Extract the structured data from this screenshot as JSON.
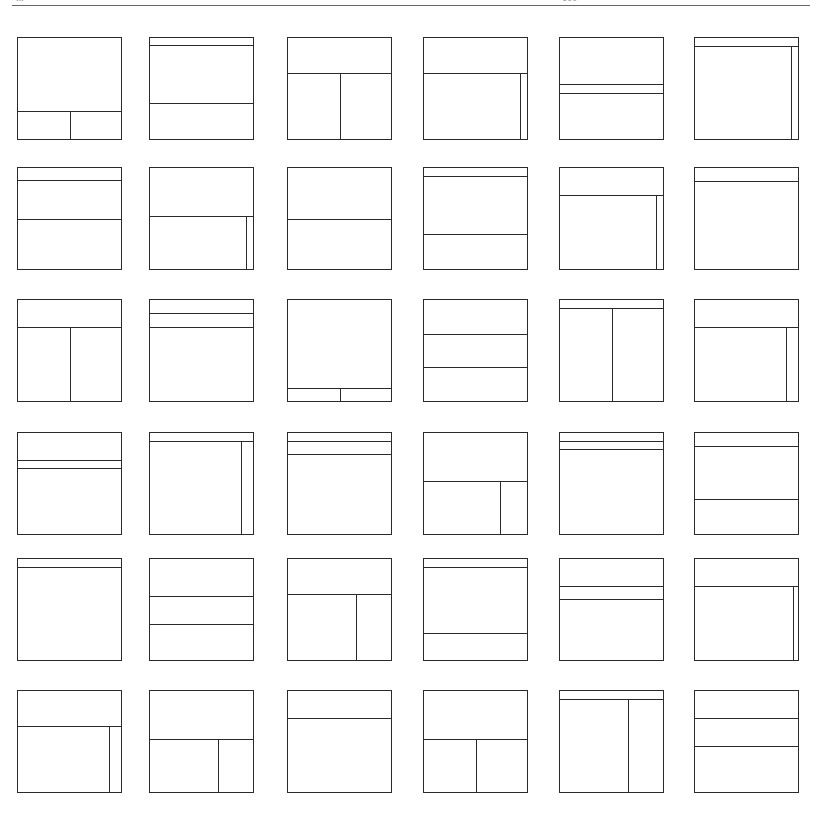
{
  "header": {
    "left_text": "...",
    "right_text": "100"
  },
  "grid": {
    "columns_x": [
      17,
      149,
      287,
      423,
      559,
      694
    ],
    "rows_y": [
      37,
      167,
      299,
      432,
      558,
      690
    ],
    "box_width": 105,
    "box_height": 103,
    "line_color": "#2a2a2a"
  },
  "layouts": [
    {
      "h": [
        0.72
      ],
      "v": [
        {
          "x": 0.5,
          "from": 0.72
        }
      ]
    },
    {
      "h": [
        0.07,
        0.64
      ],
      "v": []
    },
    {
      "h": [
        0.35
      ],
      "v": [
        {
          "x": 0.5,
          "from": 0.35
        }
      ]
    },
    {
      "h": [
        0.35
      ],
      "v": [
        {
          "x": 0.93,
          "from": 0.35
        }
      ]
    },
    {
      "h": [
        0.46,
        0.54
      ],
      "v": []
    },
    {
      "h": [
        0.08
      ],
      "v": [
        {
          "x": 0.93,
          "from": 0.08
        }
      ]
    },
    {
      "h": [
        0.12,
        0.5
      ],
      "v": []
    },
    {
      "h": [
        0.48
      ],
      "v": [
        {
          "x": 0.93,
          "from": 0.48
        }
      ]
    },
    {
      "h": [
        0.5
      ],
      "v": []
    },
    {
      "h": [
        0.08,
        0.65
      ],
      "v": []
    },
    {
      "h": [
        0.27
      ],
      "v": [
        {
          "x": 0.93,
          "from": 0.27
        }
      ]
    },
    {
      "h": [
        0.13
      ],
      "v": []
    },
    {
      "h": [
        0.27
      ],
      "v": [
        {
          "x": 0.5,
          "from": 0.27
        }
      ]
    },
    {
      "h": [
        0.13,
        0.27
      ],
      "v": []
    },
    {
      "h": [
        0.87
      ],
      "v": [
        {
          "x": 0.5,
          "from": 0.87
        }
      ]
    },
    {
      "h": [
        0.34,
        0.66
      ],
      "v": []
    },
    {
      "h": [
        0.08
      ],
      "v": [
        {
          "x": 0.5,
          "from": 0.08
        }
      ]
    },
    {
      "h": [
        0.27
      ],
      "v": [
        {
          "x": 0.88,
          "from": 0.27
        }
      ]
    },
    {
      "h": [
        0.27,
        0.35
      ],
      "v": []
    },
    {
      "h": [
        0.08
      ],
      "v": [
        {
          "x": 0.88,
          "from": 0.08
        }
      ]
    },
    {
      "h": [
        0.08,
        0.21
      ],
      "v": []
    },
    {
      "h": [
        0.48
      ],
      "v": [
        {
          "x": 0.74,
          "from": 0.48
        }
      ]
    },
    {
      "h": [
        0.08,
        0.16
      ],
      "v": []
    },
    {
      "h": [
        0.13,
        0.65
      ],
      "v": []
    },
    {
      "h": [
        0.08
      ],
      "v": []
    },
    {
      "h": [
        0.37,
        0.64
      ],
      "v": []
    },
    {
      "h": [
        0.35
      ],
      "v": [
        {
          "x": 0.66,
          "from": 0.35
        }
      ]
    },
    {
      "h": [
        0.08,
        0.73
      ],
      "v": []
    },
    {
      "h": [
        0.27,
        0.4
      ],
      "v": []
    },
    {
      "h": [
        0.27
      ],
      "v": [
        {
          "x": 0.95,
          "from": 0.27
        }
      ]
    },
    {
      "h": [
        0.35
      ],
      "v": [
        {
          "x": 0.88,
          "from": 0.35
        }
      ]
    },
    {
      "h": [
        0.48
      ],
      "v": [
        {
          "x": 0.66,
          "from": 0.48
        }
      ]
    },
    {
      "h": [
        0.27
      ],
      "v": []
    },
    {
      "h": [
        0.48
      ],
      "v": [
        {
          "x": 0.5,
          "from": 0.48
        }
      ]
    },
    {
      "h": [
        0.08
      ],
      "v": [
        {
          "x": 0.66,
          "from": 0.08
        }
      ]
    },
    {
      "h": [
        0.27,
        0.54
      ],
      "v": []
    }
  ]
}
